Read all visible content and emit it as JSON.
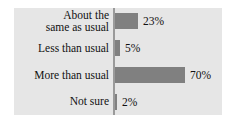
{
  "chart_data": {
    "type": "bar",
    "orientation": "horizontal",
    "title": "",
    "xlabel": "",
    "ylabel": "",
    "xlim": [
      0,
      100
    ],
    "grid": false,
    "legend": false,
    "units": "%",
    "categories": [
      "About the\nsame as usual",
      "Less than usual",
      "More than usual",
      "Not sure"
    ],
    "values": [
      23,
      5,
      70,
      2
    ],
    "value_labels": [
      "23%",
      "5%",
      "70%",
      "2%"
    ],
    "colors": {
      "bar": "#808080",
      "panel_background": "#e6e6e6",
      "page_background": "#ffffff",
      "axis_line": "#9a9a9a",
      "text": "#111111"
    }
  }
}
